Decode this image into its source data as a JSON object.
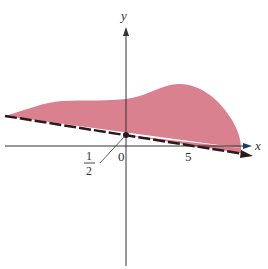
{
  "figure": {
    "colors": {
      "region_fill": "#d87a8a",
      "axis": "#333333",
      "boundary": "#2a1a1a",
      "background": "#ffffff"
    },
    "axes": {
      "x_label": "x",
      "y_label": "y"
    },
    "tick_labels": {
      "origin": "0",
      "five": "5"
    },
    "annotation": {
      "numerator": "1",
      "denominator": "2"
    },
    "boundary_line": {
      "style": "dashed",
      "y_intercept": "1/2"
    }
  }
}
